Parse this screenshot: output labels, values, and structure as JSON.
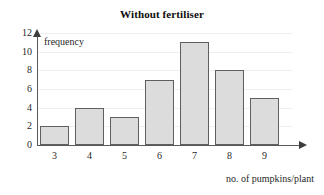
{
  "chart_data": {
    "type": "bar",
    "title": "Without fertiliser",
    "xlabel": "no. of pumpkins/plant",
    "ylabel": "frequency",
    "categories": [
      "3",
      "4",
      "5",
      "6",
      "7",
      "8",
      "9"
    ],
    "values": [
      2,
      4,
      3,
      7,
      11,
      8,
      5
    ],
    "ylim": [
      0,
      12
    ],
    "ytick_labels": [
      "0",
      "2",
      "4",
      "6",
      "8",
      "10",
      "12"
    ],
    "ytick_values": [
      0,
      2,
      4,
      6,
      8,
      10,
      12
    ],
    "grid": true,
    "legend": "none",
    "colors": {
      "bar_fill": "#dcdcdc",
      "bar_border": "#5f5f5f",
      "axis": "#5a5a5a",
      "gridline": "#f0eef0",
      "text": "#1f1f1f",
      "background": "#ffffff"
    }
  }
}
